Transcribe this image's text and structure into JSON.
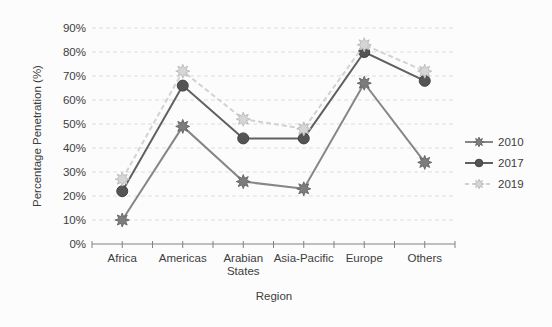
{
  "figure": {
    "background": "#fcfcfc",
    "text_color": "#3d3d3d",
    "gridline_color": "#dddddd",
    "axis_color": "#828282"
  },
  "chart_data": {
    "type": "line",
    "title": "",
    "xlabel": "Region",
    "ylabel": "Percentage Penetration (%)",
    "categories": [
      "Africa",
      "Americas",
      "Arabian\nStates",
      "Asia-Pacific",
      "Europe",
      "Others"
    ],
    "ylim": [
      0,
      90
    ],
    "yticks": [
      0,
      10,
      20,
      30,
      40,
      50,
      60,
      70,
      80,
      90
    ],
    "ytick_suffix": "%",
    "grid": "horizontal-dashed",
    "legend_position": "right",
    "series": [
      {
        "name": "2010",
        "marker": "star",
        "line_style": "solid",
        "color": "#868686",
        "marker_fill": "#7d7d7d",
        "marker_edge": "#6a6a6a",
        "values": [
          10,
          49,
          26,
          23,
          67,
          34
        ]
      },
      {
        "name": "2017",
        "marker": "circle",
        "line_style": "solid",
        "color": "#606060",
        "marker_fill": "#545454",
        "marker_edge": "#424242",
        "values": [
          22,
          66,
          44,
          44,
          80,
          68
        ]
      },
      {
        "name": "2019",
        "marker": "star",
        "line_style": "dashed",
        "color": "#d2d2d2",
        "marker_fill": "#d6d6d6",
        "marker_edge": "#bfbfbf",
        "values": [
          27,
          72,
          52,
          48,
          83,
          72
        ]
      }
    ]
  }
}
